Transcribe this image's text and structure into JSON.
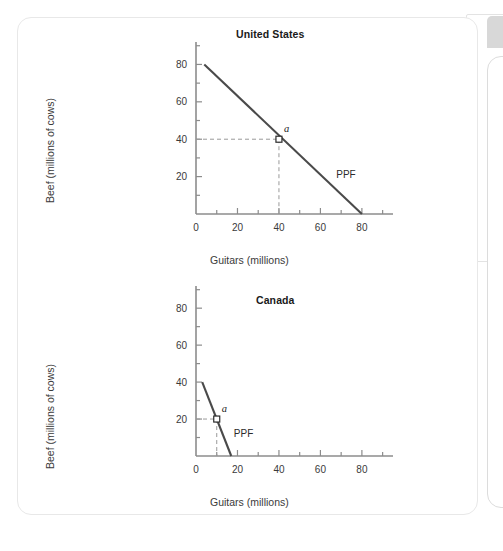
{
  "card": {
    "name": "production-possibilities-frontier-figure"
  },
  "edge_chrome": {
    "tab_chip": "",
    "panel_outline": "",
    "rounded_panel": ""
  },
  "axes_common": {
    "xlabel": "Guitars (millions)",
    "ylabel": "Beef (millions of cows)",
    "x_ticks": [
      0,
      20,
      40,
      60,
      80
    ],
    "y_ticks": [
      0,
      20,
      40,
      60,
      80
    ],
    "x_minor_step": 10,
    "y_minor_step": 10,
    "xlim": [
      0,
      95
    ],
    "ylim": [
      0,
      92
    ],
    "axis_color": "#8c8c8c",
    "line_color": "#4a4a4a",
    "guide_color": "#9a9a9a"
  },
  "chart_data": [
    {
      "type": "line",
      "title": "United States",
      "xlabel": "Guitars (millions)",
      "ylabel": "Beef (millions of cows)",
      "xlim": [
        0,
        95
      ],
      "ylim": [
        0,
        92
      ],
      "x_ticks": [
        0,
        20,
        40,
        60,
        80
      ],
      "y_ticks": [
        0,
        20,
        40,
        60,
        80
      ],
      "grid": false,
      "legend": "none",
      "series": [
        {
          "name": "PPF",
          "label": "PPF",
          "x": [
            4,
            80
          ],
          "y": [
            80,
            0
          ]
        }
      ],
      "annotations": [
        {
          "label": "a",
          "x": 40,
          "y": 40,
          "marker": "open-square",
          "guides": "dashed-to-axes"
        }
      ]
    },
    {
      "type": "line",
      "title": "Canada",
      "xlabel": "Guitars (millions)",
      "ylabel": "Beef (millions of cows)",
      "xlim": [
        0,
        95
      ],
      "ylim": [
        0,
        92
      ],
      "x_ticks": [
        0,
        20,
        40,
        60,
        80
      ],
      "y_ticks": [
        0,
        20,
        40,
        60,
        80
      ],
      "grid": false,
      "legend": "none",
      "series": [
        {
          "name": "PPF",
          "label": "PPF",
          "x": [
            3,
            17
          ],
          "y": [
            40,
            0
          ]
        }
      ],
      "annotations": [
        {
          "label": "a",
          "x": 10,
          "y": 20,
          "marker": "open-square",
          "guides": "dashed-to-axes"
        }
      ]
    }
  ]
}
